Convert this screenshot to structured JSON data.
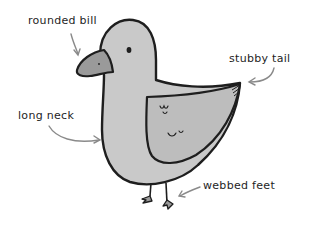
{
  "diagram": {
    "labels": [
      {
        "id": "bill",
        "text": "rounded bill",
        "x": 28,
        "y": 15
      },
      {
        "id": "tail",
        "text": "stubby tail",
        "x": 229,
        "y": 53
      },
      {
        "id": "neck",
        "text": "long neck",
        "x": 18,
        "y": 110
      },
      {
        "id": "feet",
        "text": "webbed feet",
        "x": 203,
        "y": 180
      }
    ],
    "colors": {
      "outline": "#1e1e1e",
      "body_fill": "#c9c9c9",
      "bill_fill": "#9a9a9a",
      "wing_fill": "#bdbdbd",
      "arrow": "#8a8a8a",
      "background": "#ffffff"
    }
  }
}
